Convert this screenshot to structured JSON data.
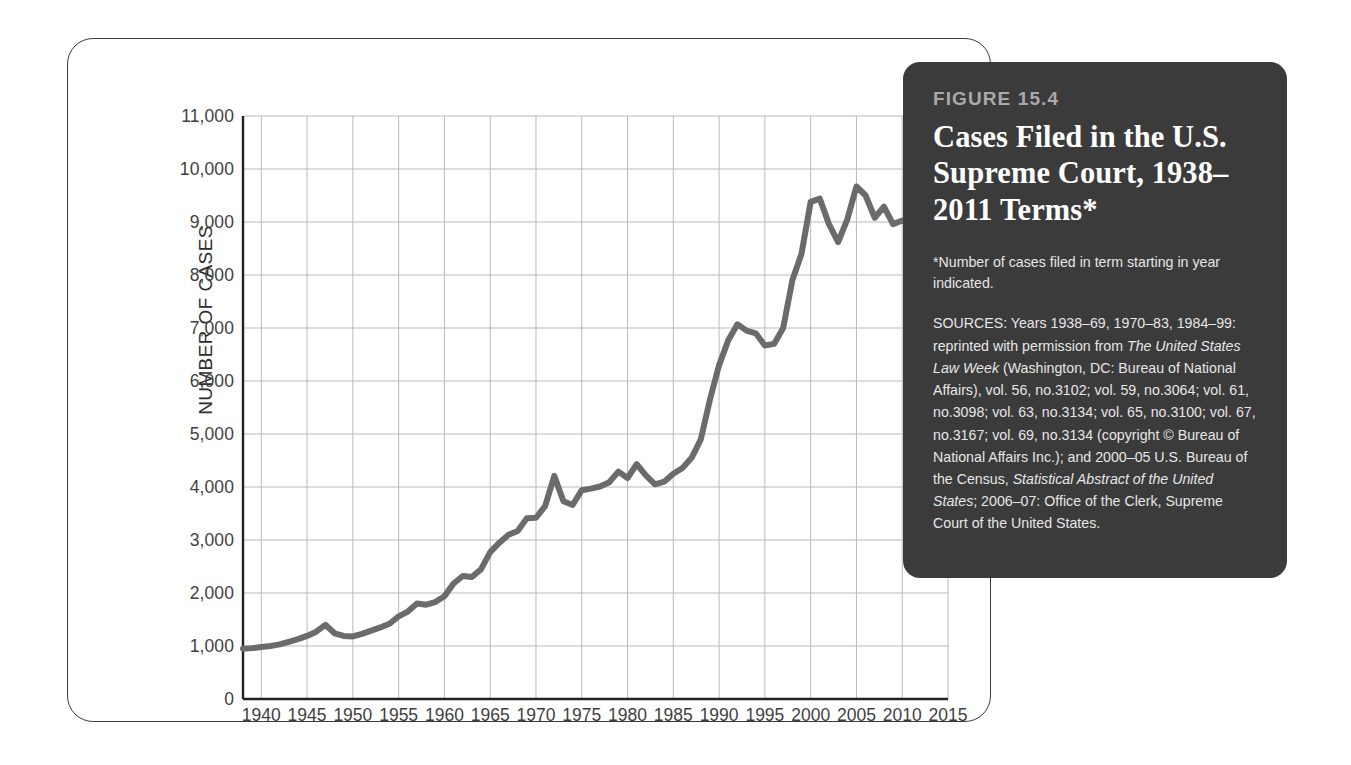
{
  "figure": {
    "number_label": "FIGURE 15.4",
    "title": "Cases Filed in the U.S. Supreme Court, 1938–2011 Terms*",
    "footnote": "*Number of cases filed in term starting in year indicated.",
    "sources_prefix": "SOURCES: Years 1938–69, 1970–83, 1984–99: reprinted with permission from ",
    "sources_italic_1": "The United States Law Week",
    "sources_mid": " (Washington, DC: Bureau of National Affairs), vol. 56, no.3102; vol. 59, no.3064; vol. 61, no.3098; vol. 63, no.3134; vol. 65, no.3100; vol. 67, no.3167; vol. 69, no.3134 (copyright © Bureau of National Affairs Inc.); and 2000–05 U.S. Bureau of the Census, ",
    "sources_italic_2": "Statistical Abstract of the United States",
    "sources_suffix": "; 2006–07: Office of the Clerk, Supreme Court of the United States.",
    "panel_bg": "#3b3b3b",
    "number_color": "#a9a9a9"
  },
  "chart_data": {
    "type": "line",
    "title": "Cases Filed in the U.S. Supreme Court, 1938–2011 Terms*",
    "xlabel": "",
    "ylabel": "NUMBER OF CASES",
    "xlim": [
      1938,
      2015
    ],
    "ylim": [
      0,
      11000
    ],
    "grid": true,
    "legend": "none",
    "line_color": "#6b6b6b",
    "line_width_px": 6,
    "ytick_labels": [
      "11,000",
      "10,000",
      "9,000",
      "8,000",
      "7,000",
      "6,000",
      "5,000",
      "4,000",
      "3,000",
      "2,000",
      "1,000",
      "0"
    ],
    "ytick_values": [
      11000,
      10000,
      9000,
      8000,
      7000,
      6000,
      5000,
      4000,
      3000,
      2000,
      1000,
      0
    ],
    "xtick_labels": [
      "1940",
      "1945",
      "1950",
      "1955",
      "1960",
      "1965",
      "1970",
      "1975",
      "1980",
      "1985",
      "1990",
      "1995",
      "2000",
      "2005",
      "2010",
      "2015"
    ],
    "xtick_values": [
      1940,
      1945,
      1950,
      1955,
      1960,
      1965,
      1970,
      1975,
      1980,
      1985,
      1990,
      1995,
      2000,
      2005,
      2010,
      2015
    ],
    "series": [
      {
        "name": "Cases filed",
        "x": [
          1938,
          1939,
          1940,
          1941,
          1942,
          1943,
          1944,
          1945,
          1946,
          1947,
          1948,
          1949,
          1950,
          1951,
          1952,
          1953,
          1954,
          1955,
          1956,
          1957,
          1958,
          1959,
          1960,
          1961,
          1962,
          1963,
          1964,
          1965,
          1966,
          1967,
          1968,
          1969,
          1970,
          1971,
          1972,
          1973,
          1974,
          1975,
          1976,
          1977,
          1978,
          1979,
          1980,
          1981,
          1982,
          1983,
          1984,
          1985,
          1986,
          1987,
          1988,
          1989,
          1990,
          1991,
          1992,
          1993,
          1994,
          1995,
          1996,
          1997,
          1998,
          1999,
          2000,
          2001,
          2002,
          2003,
          2004,
          2005,
          2006,
          2007,
          2008,
          2009,
          2010,
          2011
        ],
        "values": [
          950,
          960,
          980,
          1000,
          1030,
          1080,
          1130,
          1190,
          1270,
          1400,
          1240,
          1190,
          1180,
          1230,
          1290,
          1350,
          1420,
          1560,
          1650,
          1800,
          1780,
          1830,
          1940,
          2180,
          2320,
          2300,
          2450,
          2770,
          2950,
          3100,
          3170,
          3410,
          3420,
          3640,
          4210,
          3730,
          3660,
          3940,
          3970,
          4010,
          4090,
          4290,
          4170,
          4430,
          4220,
          4050,
          4100,
          4250,
          4360,
          4550,
          4900,
          5650,
          6300,
          6770,
          7070,
          6950,
          6900,
          6670,
          6700,
          7000,
          7900,
          8400,
          9380,
          9440,
          8960,
          8620,
          9050,
          9670,
          9500,
          9080,
          9290,
          8960,
          9030,
          8950
        ]
      }
    ]
  },
  "axis": {
    "y_title": "NUMBER OF CASES"
  }
}
